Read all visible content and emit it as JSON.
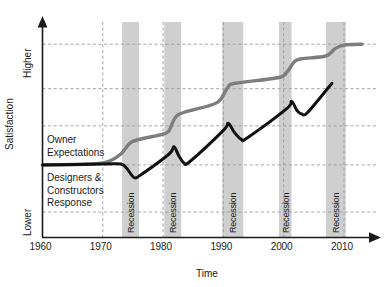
{
  "chart_data": {
    "type": "line",
    "title": "",
    "xlabel": "Time",
    "ylabel": "Satisfaction",
    "x_ticks": [
      "1960",
      "1970",
      "1980",
      "1990",
      "2000",
      "2010"
    ],
    "x_tick_values": [
      1960,
      1970,
      1980,
      1990,
      2000,
      2010
    ],
    "xlim": [
      1960,
      2013
    ],
    "y_ticks": [
      "Lower",
      "Higher"
    ],
    "ylim": [
      0,
      100
    ],
    "grid": true,
    "grid_style": "dashed",
    "legend_position": "inline-annotations",
    "series": [
      {
        "name": "Owner Expectations",
        "color": "#7d7d7d",
        "style": "step-up-at-recessions",
        "points": [
          {
            "x": 1960,
            "y": 40
          },
          {
            "x": 1968,
            "y": 40.5
          },
          {
            "x": 1971,
            "y": 42
          },
          {
            "x": 1973,
            "y": 46
          },
          {
            "x": 1974.5,
            "y": 52
          },
          {
            "x": 1976,
            "y": 54
          },
          {
            "x": 1980,
            "y": 57
          },
          {
            "x": 1981,
            "y": 59
          },
          {
            "x": 1982,
            "y": 66
          },
          {
            "x": 1983.5,
            "y": 69
          },
          {
            "x": 1988,
            "y": 73
          },
          {
            "x": 1989.5,
            "y": 76
          },
          {
            "x": 1990.8,
            "y": 83
          },
          {
            "x": 1992,
            "y": 85
          },
          {
            "x": 1999,
            "y": 88
          },
          {
            "x": 2000.5,
            "y": 91
          },
          {
            "x": 2001.8,
            "y": 97
          },
          {
            "x": 2003,
            "y": 98.5
          },
          {
            "x": 2007,
            "y": 100
          },
          {
            "x": 2008.5,
            "y": 104
          },
          {
            "x": 2010,
            "y": 106
          },
          {
            "x": 2013,
            "y": 106.5
          }
        ]
      },
      {
        "name": "Designers & Constructors Response",
        "color": "#111111",
        "style": "sawtooth-dip-at-recessions",
        "points": [
          {
            "x": 1960,
            "y": 40
          },
          {
            "x": 1970,
            "y": 40.5
          },
          {
            "x": 1973,
            "y": 40.5
          },
          {
            "x": 1974,
            "y": 38
          },
          {
            "x": 1975.2,
            "y": 33
          },
          {
            "x": 1976.5,
            "y": 35
          },
          {
            "x": 1981,
            "y": 46
          },
          {
            "x": 1981.8,
            "y": 50
          },
          {
            "x": 1982.6,
            "y": 45
          },
          {
            "x": 1983.5,
            "y": 41
          },
          {
            "x": 1984.5,
            "y": 42
          },
          {
            "x": 1990,
            "y": 59
          },
          {
            "x": 1990.8,
            "y": 63
          },
          {
            "x": 1991.8,
            "y": 58
          },
          {
            "x": 1993,
            "y": 54
          },
          {
            "x": 1994,
            "y": 55
          },
          {
            "x": 2000.5,
            "y": 71
          },
          {
            "x": 2001.3,
            "y": 75
          },
          {
            "x": 2002.2,
            "y": 70
          },
          {
            "x": 2003,
            "y": 68
          },
          {
            "x": 2004,
            "y": 69
          },
          {
            "x": 2008,
            "y": 85
          }
        ]
      }
    ],
    "shaded_bands": [
      {
        "label": "Recession",
        "x_start": 1973.2,
        "x_end": 1976.0
      },
      {
        "label": "Recession",
        "x_start": 1980.2,
        "x_end": 1983.0
      },
      {
        "label": "Recession",
        "x_start": 1989.8,
        "x_end": 1993.3
      },
      {
        "label": "Recession",
        "x_start": 1999.2,
        "x_end": 2001.3
      },
      {
        "label": "Recession",
        "x_start": 2007.0,
        "x_end": 2010.3
      }
    ],
    "band_color": "#cfcfcf",
    "gridline_color": "#9a9a9a",
    "axis_color": "#1a1a1a",
    "annotations": [
      {
        "name": "owner-expectations-label",
        "lines": "Owner\nExpectations"
      },
      {
        "name": "designers-constructors-label",
        "lines": "Designers &\nConstructors\nResponse"
      }
    ]
  },
  "labels": {
    "y_axis_title": "Satisfaction",
    "x_axis_title": "Time",
    "y_high": "Higher",
    "y_low": "Lower",
    "annotation_owner": "Owner\nExpectations",
    "annotation_designers": "Designers &\nConstructors\nResponse",
    "recession": "Recession"
  },
  "x_tick_labels": [
    "1960",
    "1970",
    "1980",
    "1990",
    "2000",
    "2010"
  ]
}
